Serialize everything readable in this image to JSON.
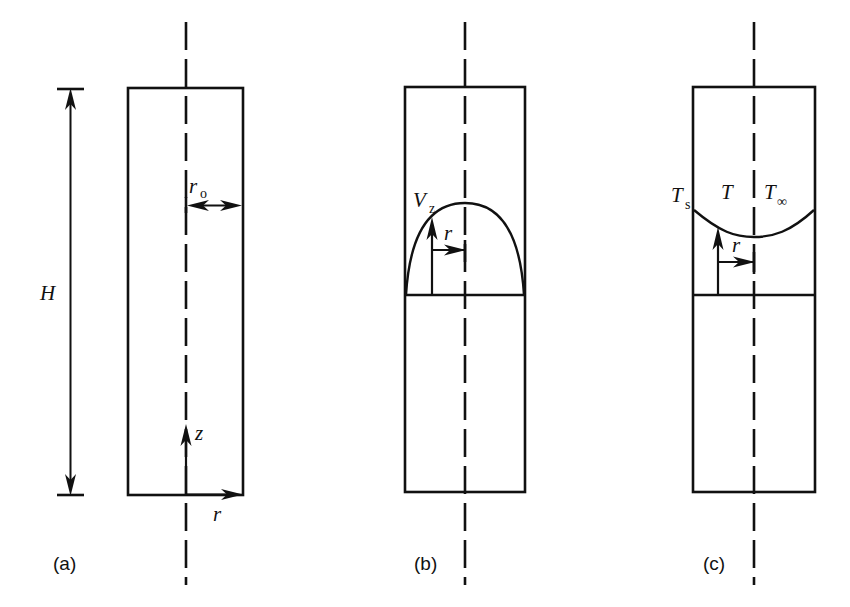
{
  "figure": {
    "background_color": "#ffffff",
    "line_color": "#111111",
    "width": 850,
    "height": 607
  },
  "panels": [
    {
      "id": "a",
      "caption": "(a)",
      "description": "Tube geometry with height and radius dimensions",
      "labels": {
        "height": "H",
        "radius": "r",
        "radius_subscript": "o",
        "axial_axis": "z",
        "radial_axis": "r"
      }
    },
    {
      "id": "b",
      "caption": "(b)",
      "description": "Parabolic axial velocity profile",
      "labels": {
        "velocity": "V",
        "velocity_subscript": "z",
        "radial_coordinate": "r"
      }
    },
    {
      "id": "c",
      "caption": "(c)",
      "description": "Temperature profile across the tube",
      "labels": {
        "surface_temperature": "T",
        "surface_subscript": "s",
        "temperature": "T",
        "bulk_temperature": "T",
        "bulk_subscript": "∞",
        "radial_coordinate": "r"
      }
    }
  ]
}
